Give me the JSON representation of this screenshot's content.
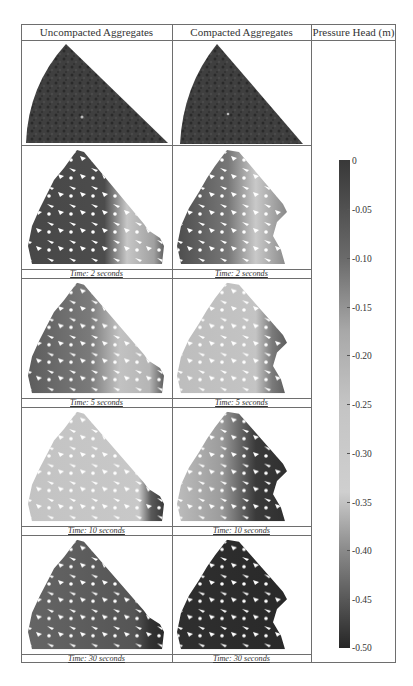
{
  "figure": {
    "headers": {
      "col1": "Uncompacted Aggregates",
      "col2": "Compacted Aggregates",
      "col3": "Pressure Head (m)"
    },
    "rows": [
      {
        "type": "ct_scan",
        "uncompacted_caption": "",
        "compacted_caption": ""
      },
      {
        "type": "simulation",
        "uncompacted_caption": "Time: 2 seconds",
        "compacted_caption": "Time: 2 seconds"
      },
      {
        "type": "simulation",
        "uncompacted_caption": "Time: 5 seconds",
        "compacted_caption": "Time: 5 seconds"
      },
      {
        "type": "simulation",
        "uncompacted_caption": "Time: 10 seconds",
        "compacted_caption": "Time: 10 seconds"
      },
      {
        "type": "simulation",
        "uncompacted_caption": "Time: 30 seconds",
        "compacted_caption": "Time: 30 seconds"
      }
    ],
    "colorbar": {
      "label": "Pressure Head (m)",
      "ticks": [
        "0",
        "-0.05",
        "-0.10",
        "-0.15",
        "-0.20",
        "-0.25",
        "-0.30",
        "-0.35",
        "-0.40",
        "-0.45",
        "-0.50"
      ],
      "min": -0.5,
      "max": 0,
      "colors": {
        "top": "#3a3a3a",
        "mid_light": "#c8c8c8",
        "bottom": "#2a2a2a"
      }
    }
  }
}
